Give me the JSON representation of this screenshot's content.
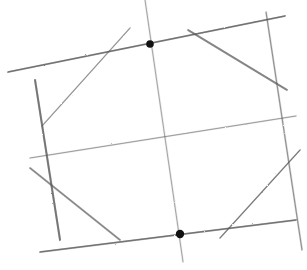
{
  "diagram": {
    "style": "pencil-sketch",
    "background": "#ffffff",
    "stroke_color": "#555555",
    "dot_color": "#111111",
    "lines": [
      {
        "id": "top-edge",
        "x1": 8,
        "y1": 72,
        "x2": 285,
        "y2": 16,
        "weight": 1.6,
        "opacity": 0.75
      },
      {
        "id": "bottom-edge",
        "x1": 40,
        "y1": 252,
        "x2": 296,
        "y2": 220,
        "weight": 1.6,
        "opacity": 0.75
      },
      {
        "id": "middle-edge",
        "x1": 30,
        "y1": 158,
        "x2": 296,
        "y2": 116,
        "weight": 1.2,
        "opacity": 0.5
      },
      {
        "id": "left-vertical",
        "x1": 35,
        "y1": 80,
        "x2": 60,
        "y2": 240,
        "weight": 1.8,
        "opacity": 0.75
      },
      {
        "id": "center-vertical",
        "x1": 145,
        "y1": 0,
        "x2": 183,
        "y2": 262,
        "weight": 1.0,
        "opacity": 0.5
      },
      {
        "id": "right-vertical",
        "x1": 266,
        "y1": 12,
        "x2": 302,
        "y2": 250,
        "weight": 1.2,
        "opacity": 0.6
      },
      {
        "id": "diag-top-left",
        "x1": 130,
        "y1": 28,
        "x2": 42,
        "y2": 126,
        "weight": 1.2,
        "opacity": 0.5
      },
      {
        "id": "diag-top-right",
        "x1": 188,
        "y1": 30,
        "x2": 287,
        "y2": 90,
        "weight": 1.6,
        "opacity": 0.7
      },
      {
        "id": "diag-bottom-left",
        "x1": 30,
        "y1": 168,
        "x2": 120,
        "y2": 240,
        "weight": 1.6,
        "opacity": 0.7
      },
      {
        "id": "diag-bottom-right",
        "x1": 300,
        "y1": 150,
        "x2": 220,
        "y2": 238,
        "weight": 1.4,
        "opacity": 0.65
      }
    ],
    "points": [
      {
        "id": "top-point",
        "cx": 150,
        "cy": 44,
        "r": 3.8
      },
      {
        "id": "bottom-point",
        "cx": 180,
        "cy": 234,
        "r": 4.2
      }
    ]
  }
}
